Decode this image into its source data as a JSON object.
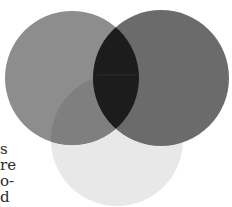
{
  "diagram": {
    "type": "three-circle-venn",
    "circles": [
      {
        "name": "left",
        "cx": 72,
        "cy": 78,
        "r": 67,
        "color": "#8d8d8d"
      },
      {
        "name": "right",
        "cx": 161,
        "cy": 78,
        "r": 68,
        "color": "#6b6b6b"
      },
      {
        "name": "bottom",
        "cx": 117,
        "cy": 140,
        "r": 66,
        "color": "#e8e8e8"
      }
    ],
    "overlap_colors": {
      "left_right": "#1c1c1c",
      "left_bottom": "#7f7f7f"
    }
  },
  "text_fragments": [
    "s",
    "re",
    "o-",
    "d"
  ]
}
